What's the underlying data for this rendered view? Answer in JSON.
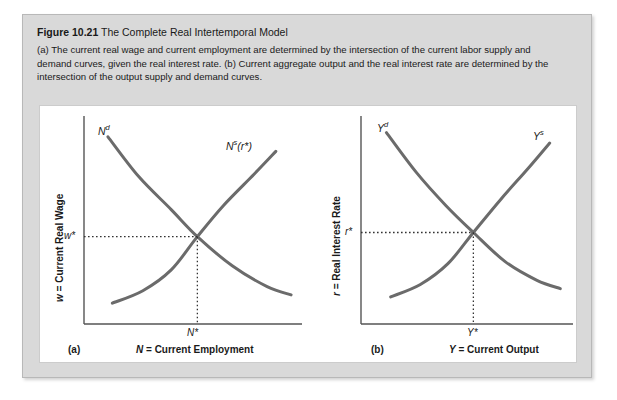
{
  "figure": {
    "number": "Figure 10.21",
    "title": "The Complete Real Intertemporal Model",
    "description": "(a) The current real wage and current employment are determined by the intersection of the current labor supply and demand curves, given the real interest rate. (b) Current aggregate output and the real interest rate are determined by the intersection of the output supply and demand curves."
  },
  "colors": {
    "card_background": "#d9d9d9",
    "plot_background": "#ffffff",
    "curve": "#6b6b6b",
    "axis": "#555555",
    "text": "#1a1a1a"
  },
  "chart_data": [
    {
      "type": "line",
      "panel_tag": "(a)",
      "title": "Current Labor Market",
      "xlabel": "N = Current Employment",
      "ylabel": "w = Current Real Wage",
      "xlabel_axis_symbol": "N",
      "xlabel_axis_text": "= Current Employment",
      "ylabel_axis_symbol": "w",
      "ylabel_axis_text": "= Current Real Wage",
      "grid": false,
      "legend": "none",
      "xlim": [
        0,
        1
      ],
      "ylim": [
        0,
        1
      ],
      "equilibrium": {
        "x_label": "N*",
        "y_label": "w*",
        "x": 0.52,
        "y": 0.42
      },
      "series": [
        {
          "name": "Nd",
          "label_base": "N",
          "label_sup": "d",
          "label_suffix": "",
          "shape": "downward-convex",
          "points": [
            [
              0.11,
              0.9
            ],
            [
              0.25,
              0.71
            ],
            [
              0.4,
              0.55
            ],
            [
              0.52,
              0.42
            ],
            [
              0.68,
              0.28
            ],
            [
              0.84,
              0.18
            ],
            [
              0.95,
              0.14
            ]
          ]
        },
        {
          "name": "Ns(r*)",
          "label_base": "N",
          "label_sup": "s",
          "label_suffix": "(r*)",
          "shape": "upward-convex",
          "points": [
            [
              0.13,
              0.1
            ],
            [
              0.27,
              0.16
            ],
            [
              0.4,
              0.26
            ],
            [
              0.52,
              0.42
            ],
            [
              0.64,
              0.57
            ],
            [
              0.78,
              0.72
            ],
            [
              0.88,
              0.83
            ]
          ]
        }
      ]
    },
    {
      "type": "line",
      "panel_tag": "(b)",
      "title": "Output Market",
      "xlabel": "Y = Current Output",
      "ylabel": "r = Real Interest Rate",
      "xlabel_axis_symbol": "Y",
      "xlabel_axis_text": "= Current Output",
      "ylabel_axis_symbol": "r",
      "ylabel_axis_text": "= Real Interest Rate",
      "grid": false,
      "legend": "none",
      "xlim": [
        0,
        1
      ],
      "ylim": [
        0,
        1
      ],
      "equilibrium": {
        "x_label": "Y*",
        "y_label": "r*",
        "x": 0.53,
        "y": 0.44
      },
      "series": [
        {
          "name": "Yd",
          "label_base": "Y",
          "label_sup": "d",
          "label_suffix": "",
          "shape": "downward-convex",
          "points": [
            [
              0.12,
              0.92
            ],
            [
              0.26,
              0.73
            ],
            [
              0.4,
              0.57
            ],
            [
              0.53,
              0.44
            ],
            [
              0.68,
              0.3
            ],
            [
              0.83,
              0.21
            ],
            [
              0.94,
              0.17
            ]
          ]
        },
        {
          "name": "Ys",
          "label_base": "Y",
          "label_sup": "s",
          "label_suffix": "",
          "shape": "upward-convex",
          "points": [
            [
              0.14,
              0.13
            ],
            [
              0.28,
              0.19
            ],
            [
              0.41,
              0.29
            ],
            [
              0.53,
              0.44
            ],
            [
              0.66,
              0.6
            ],
            [
              0.79,
              0.75
            ],
            [
              0.89,
              0.87
            ]
          ]
        }
      ]
    }
  ]
}
